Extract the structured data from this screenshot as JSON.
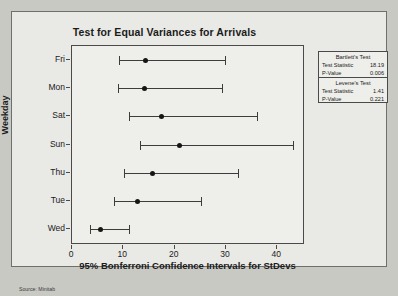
{
  "slide": {
    "source_caption": "Source: Minitab"
  },
  "chart_data": {
    "type": "scatter",
    "title": "Test for Equal Variances for Arrivals",
    "xlabel": "95% Bonferroni Confidence Intervals for StDevs",
    "ylabel": "Weekday",
    "xlim": [
      0,
      45
    ],
    "xticks": [
      "0",
      "10",
      "20",
      "30",
      "40"
    ],
    "xtick_values": [
      0,
      10,
      20,
      30,
      40
    ],
    "grid": false,
    "legend": "none",
    "categories": [
      "Fri",
      "Mon",
      "Sat",
      "Sun",
      "Thu",
      "Tue",
      "Wed"
    ],
    "intervals": [
      {
        "category": "Fri",
        "lower": 9.2,
        "center": 14.4,
        "upper": 29.8
      },
      {
        "category": "Mon",
        "lower": 8.9,
        "center": 14.1,
        "upper": 29.2
      },
      {
        "category": "Sat",
        "lower": 11.1,
        "center": 17.4,
        "upper": 36.0
      },
      {
        "category": "Sun",
        "lower": 13.3,
        "center": 21.0,
        "upper": 43.1
      },
      {
        "category": "Thu",
        "lower": 10.2,
        "center": 15.7,
        "upper": 32.4
      },
      {
        "category": "Tue",
        "lower": 8.2,
        "center": 12.7,
        "upper": 25.2
      },
      {
        "category": "Wed",
        "lower": 3.5,
        "center": 5.5,
        "upper": 11.2
      }
    ]
  },
  "stats_box": {
    "bartlett": {
      "heading": "Bartlett's Test",
      "rows": [
        {
          "label": "Test Statistic",
          "value": "18.19"
        },
        {
          "label": "P-Value",
          "value": "0.006"
        }
      ]
    },
    "levene": {
      "heading": "Levene's Test",
      "rows": [
        {
          "label": "Test Statistic",
          "value": "1.41"
        },
        {
          "label": "P-Value",
          "value": "0.221"
        }
      ]
    }
  }
}
